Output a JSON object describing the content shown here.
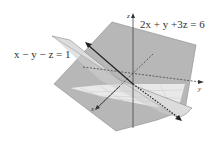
{
  "diagram": {
    "plane1": {
      "equation": "2x + y +3z = 6",
      "fill": "#b4b4b4",
      "stroke": "#888888"
    },
    "plane2": {
      "equation": "x − y − z = 1",
      "fill": "#d9d9d9",
      "stroke": "#8a8a8a"
    },
    "axes": {
      "x": "x",
      "y": "y",
      "z": "z"
    },
    "intersection_line": {
      "color": "#222222"
    },
    "grid_color": "#ffffff"
  }
}
